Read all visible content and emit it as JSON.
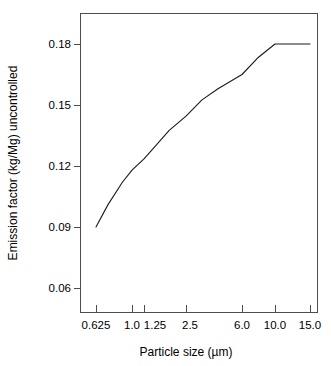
{
  "chart_data": {
    "type": "line",
    "title": "",
    "xlabel": "Particle size (µm)",
    "ylabel": "Emission factor (kg/Mg) uncontrolled",
    "x_tick_labels": [
      "0.625",
      "1.0",
      "1.25",
      "2.5",
      "6.0",
      "10.0",
      "15.0"
    ],
    "x_tick_values": [
      0.625,
      1.0,
      1.25,
      2.5,
      6.0,
      10.0,
      15.0
    ],
    "y_tick_labels": [
      "0.06",
      "0.09",
      "0.12",
      "0.15",
      "0.18"
    ],
    "y_tick_values": [
      0.06,
      0.09,
      0.12,
      0.15,
      0.18
    ],
    "ylim": [
      0.048,
      0.1865
    ],
    "xlim_labels": [
      "0.625",
      "15.0"
    ],
    "grid": false,
    "legend": "none",
    "scale_note": "x axis non-linear (log-like, ticks unevenly spaced)",
    "series": [
      {
        "name": "Uncontrolled emission factor",
        "color": "#1a1a1a",
        "x": [
          0.625,
          0.75,
          0.9,
          1.0,
          1.25,
          1.6,
          2.0,
          2.5,
          3.5,
          4.5,
          6.0,
          8.0,
          10.0,
          12.0,
          15.0
        ],
        "values": [
          0.09,
          0.101,
          0.112,
          0.118,
          0.1235,
          0.13,
          0.1375,
          0.1445,
          0.1525,
          0.158,
          0.165,
          0.1735,
          0.18,
          0.18,
          0.18
        ]
      }
    ]
  },
  "axis": {
    "x_title": "Particle size (µm)",
    "y_title": "Emission factor (kg/Mg) uncontrolled"
  },
  "ticks": {
    "x": [
      {
        "label": "0.625",
        "px": 96
      },
      {
        "label": "1.0",
        "px": 132
      },
      {
        "label": "1.25",
        "px": 144
      },
      {
        "label": "2.5",
        "px": 186
      },
      {
        "label": "6.0",
        "px": 242
      },
      {
        "label": "10.0",
        "px": 275
      },
      {
        "label": "15.0",
        "px": 310
      }
    ],
    "y": [
      {
        "label": "0.18",
        "px": 44
      },
      {
        "label": "0.15",
        "px": 105
      },
      {
        "label": "0.12",
        "px": 166
      },
      {
        "label": "0.09",
        "px": 227
      },
      {
        "label": "0.06",
        "px": 288
      }
    ]
  },
  "style": {
    "line_color": "#1a1a1a",
    "frame_color": "#4d4d4d",
    "background": "#ffffff"
  }
}
